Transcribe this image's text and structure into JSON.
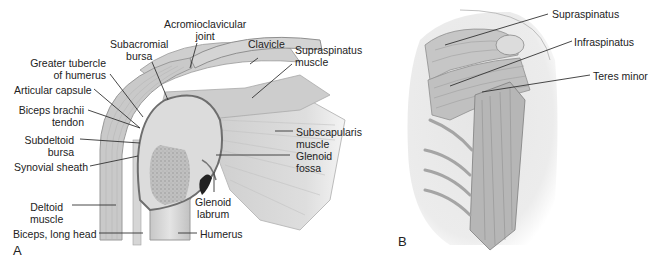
{
  "figure": {
    "panel_a": {
      "letter": "A",
      "labels": {
        "acromioclavicular_joint": [
          "Acromioclavicular",
          "joint"
        ],
        "subacromial_bursa": [
          "Subacromial",
          "bursa"
        ],
        "clavicle": "Clavicle",
        "greater_tubercle": [
          "Greater tubercle",
          "of humerus"
        ],
        "supraspinatus_muscle": [
          "Supraspinatus",
          "muscle"
        ],
        "articular_capsule": "Articular capsule",
        "biceps_brachii_tendon": [
          "Biceps brachii",
          "tendon"
        ],
        "subdeltoid_bursa": [
          "Subdeltoid",
          "bursa"
        ],
        "subscapularis_muscle": [
          "Subscapularis",
          "muscle"
        ],
        "synovial_sheath": "Synovial sheath",
        "glenoid_fossa": [
          "Glenoid",
          "fossa"
        ],
        "glenoid_labrum": [
          "Glenoid",
          "labrum"
        ],
        "deltoid_muscle": [
          "Deltoid",
          "muscle"
        ],
        "biceps_long_head": "Biceps, long head",
        "humerus": "Humerus"
      }
    },
    "panel_b": {
      "letter": "B",
      "labels": {
        "supraspinatus": "Supraspinatus",
        "infraspinatus": "Infraspinatus",
        "teres_minor": "Teres minor"
      }
    },
    "colors": {
      "background": "#ffffff",
      "text": "#222222",
      "leader_line": "#333333",
      "bone": "#d9d9d9",
      "bone_dark": "#a8a8a8",
      "muscle": "#bdbdbd",
      "muscle_dark": "#8c8c8c",
      "shadow": "#e8e8e8"
    }
  }
}
